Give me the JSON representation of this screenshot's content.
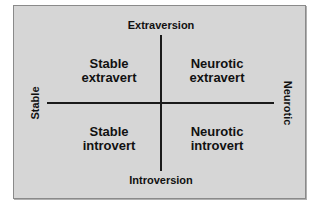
{
  "diagram": {
    "type": "quadrant",
    "colors": {
      "background": "#d6d6d6",
      "border": "#8a8a8a",
      "axis": "#1a1a1a",
      "text": "#111111"
    },
    "axes": {
      "vertical": {
        "top_label": "Extraversion",
        "bottom_label": "Introversion"
      },
      "horizontal": {
        "left_label": "Stable",
        "right_label": "Neurotic"
      }
    },
    "quadrants": {
      "top_left": {
        "line1": "Stable",
        "line2": "extravert"
      },
      "top_right": {
        "line1": "Neurotic",
        "line2": "extravert"
      },
      "bottom_left": {
        "line1": "Stable",
        "line2": "introvert"
      },
      "bottom_right": {
        "line1": "Neurotic",
        "line2": "introvert"
      }
    }
  }
}
